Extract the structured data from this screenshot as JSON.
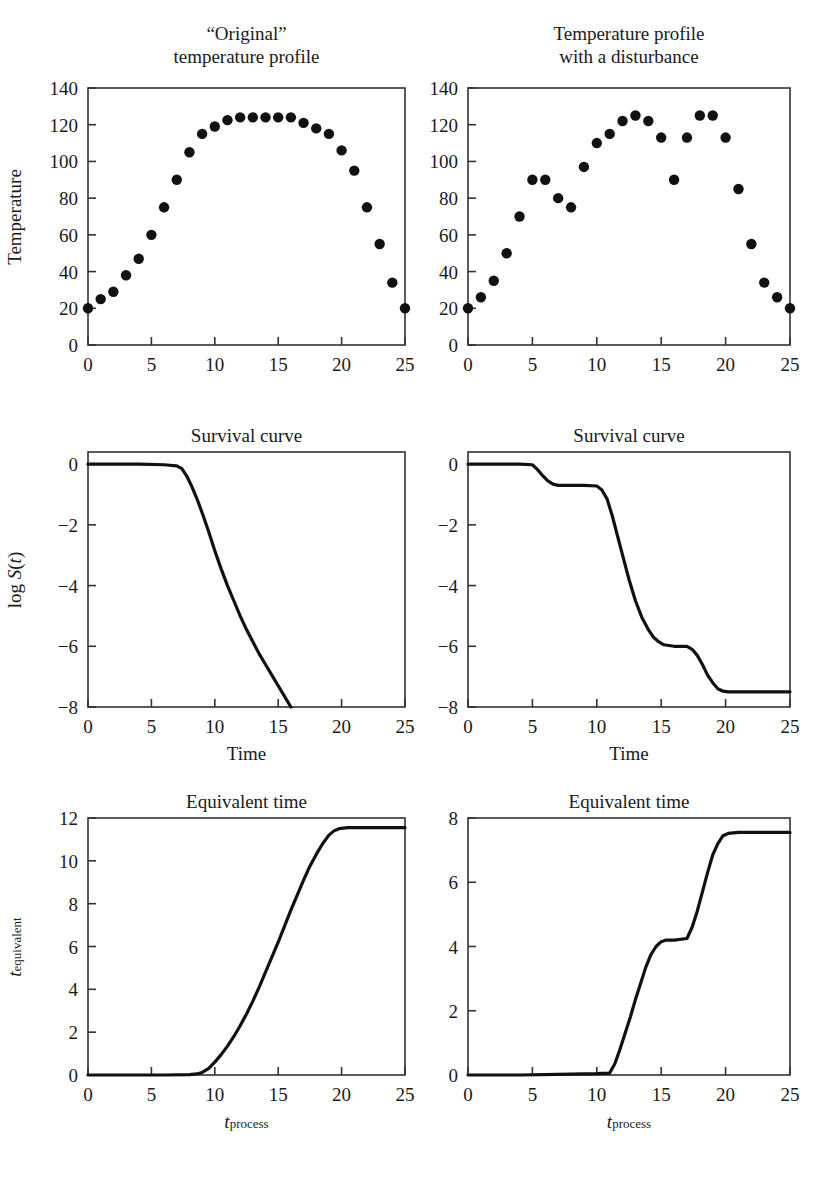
{
  "figure": {
    "width": 827,
    "height": 1192,
    "line_color": "#111111",
    "marker_color": "#111111",
    "axis_color": "#333333"
  },
  "panels": [
    {
      "id": "top-left",
      "title_line1": "“Original”",
      "title_line2": "temperature profile",
      "ylabel": "Temperature",
      "xlabel": "",
      "yticks": [
        "0",
        "20",
        "40",
        "60",
        "80",
        "100",
        "120",
        "140"
      ],
      "xticks": [
        "0",
        "5",
        "10",
        "15",
        "20",
        "25"
      ]
    },
    {
      "id": "top-right",
      "title_line1": "Temperature profile",
      "title_line2": "with a disturbance",
      "ylabel": "",
      "xlabel": "",
      "yticks": [
        "0",
        "20",
        "40",
        "60",
        "80",
        "100",
        "120",
        "140"
      ],
      "xticks": [
        "0",
        "5",
        "10",
        "15",
        "20",
        "25"
      ]
    },
    {
      "id": "mid-left",
      "title_line1": "Survival curve",
      "title_line2": "",
      "ylabel": "log S(t)",
      "xlabel": "Time",
      "yticks": [
        "−8",
        "−6",
        "−4",
        "−2",
        "0"
      ],
      "xticks": [
        "0",
        "5",
        "10",
        "15",
        "20",
        "25"
      ]
    },
    {
      "id": "mid-right",
      "title_line1": "Survival curve",
      "title_line2": "",
      "ylabel": "",
      "xlabel": "Time",
      "yticks": [
        "−8",
        "−6",
        "−4",
        "−2",
        "0"
      ],
      "xticks": [
        "0",
        "5",
        "10",
        "15",
        "20",
        "25"
      ]
    },
    {
      "id": "bot-left",
      "title_line1": "Equivalent time",
      "title_line2": "",
      "ylabel": "t_equivalent",
      "xlabel": "t_process",
      "yticks": [
        "0",
        "2",
        "4",
        "6",
        "8",
        "10",
        "12"
      ],
      "xticks": [
        "0",
        "5",
        "10",
        "15",
        "20",
        "25"
      ]
    },
    {
      "id": "bot-right",
      "title_line1": "Equivalent time",
      "title_line2": "",
      "ylabel": "",
      "xlabel": "t_process",
      "yticks": [
        "0",
        "2",
        "4",
        "6",
        "8"
      ],
      "xticks": [
        "0",
        "5",
        "10",
        "15",
        "20",
        "25"
      ]
    }
  ],
  "chart_data": [
    {
      "type": "scatter",
      "panel": "top-left",
      "title": "“Original” temperature profile",
      "xlabel": "",
      "ylabel": "Temperature",
      "xlim": [
        0,
        25
      ],
      "ylim": [
        0,
        140
      ],
      "xticks": [
        0,
        5,
        10,
        15,
        20,
        25
      ],
      "yticks": [
        0,
        20,
        40,
        60,
        80,
        100,
        120,
        140
      ],
      "grid": false,
      "legend": null,
      "x": [
        0,
        1,
        2,
        3,
        4,
        5,
        6,
        7,
        8,
        9,
        10,
        11,
        12,
        13,
        14,
        15,
        16,
        17,
        18,
        19,
        20,
        21,
        22,
        23,
        24,
        25
      ],
      "y": [
        20,
        25,
        29,
        38,
        47,
        60,
        75,
        90,
        105,
        115,
        119,
        122.5,
        124,
        124,
        124,
        124,
        124,
        121,
        118,
        115,
        106,
        95,
        75,
        55,
        34,
        20
      ]
    },
    {
      "type": "scatter",
      "panel": "top-right",
      "title": "Temperature profile with a disturbance",
      "xlabel": "",
      "ylabel": "",
      "xlim": [
        0,
        25
      ],
      "ylim": [
        0,
        140
      ],
      "xticks": [
        0,
        5,
        10,
        15,
        20,
        25
      ],
      "yticks": [
        0,
        20,
        40,
        60,
        80,
        100,
        120,
        140
      ],
      "grid": false,
      "legend": null,
      "x": [
        0,
        1,
        2,
        3,
        4,
        5,
        6,
        7,
        8,
        9,
        10,
        11,
        12,
        13,
        14,
        15,
        16,
        17,
        18,
        19,
        20,
        21,
        22,
        23,
        24,
        25
      ],
      "y": [
        20,
        26,
        35,
        50,
        70,
        90,
        90,
        80,
        75,
        97,
        110,
        115,
        122,
        125,
        122,
        113,
        90,
        113,
        125,
        125,
        113,
        85,
        55,
        34,
        26,
        20
      ]
    },
    {
      "type": "line",
      "panel": "mid-left",
      "title": "Survival curve",
      "xlabel": "Time",
      "ylabel": "log S(t)",
      "xlim": [
        0,
        25
      ],
      "ylim": [
        -8,
        0.4
      ],
      "xticks": [
        0,
        5,
        10,
        15,
        20,
        25
      ],
      "yticks": [
        -8,
        -6,
        -4,
        -2,
        0
      ],
      "grid": false,
      "legend": null,
      "x": [
        0,
        2,
        4,
        6,
        7,
        7.4,
        7.8,
        8.2,
        8.6,
        9,
        9.5,
        10,
        10.5,
        11,
        11.5,
        12,
        12.5,
        13,
        13.5,
        14,
        14.5,
        15,
        15.5,
        16
      ],
      "y": [
        0,
        0,
        0,
        -0.02,
        -0.06,
        -0.15,
        -0.4,
        -0.75,
        -1.15,
        -1.6,
        -2.2,
        -2.85,
        -3.45,
        -4.0,
        -4.5,
        -5.0,
        -5.45,
        -5.85,
        -6.25,
        -6.6,
        -6.95,
        -7.3,
        -7.65,
        -8.0
      ]
    },
    {
      "type": "line",
      "panel": "mid-right",
      "title": "Survival curve",
      "xlabel": "Time",
      "ylabel": "",
      "xlim": [
        0,
        25
      ],
      "ylim": [
        -8,
        0.4
      ],
      "xticks": [
        0,
        5,
        10,
        15,
        20,
        25
      ],
      "yticks": [
        -8,
        -6,
        -4,
        -2,
        0
      ],
      "grid": false,
      "legend": null,
      "x": [
        0,
        2,
        4,
        5,
        5.4,
        5.8,
        6.2,
        6.6,
        7,
        8,
        9,
        10,
        10.4,
        10.8,
        11.2,
        11.6,
        12,
        12.5,
        13,
        13.5,
        14,
        14.4,
        14.8,
        15.2,
        16,
        17,
        17.4,
        17.8,
        18.2,
        18.6,
        19,
        19.4,
        19.8,
        20.2,
        21,
        23,
        25
      ],
      "y": [
        0,
        0,
        0,
        -0.02,
        -0.18,
        -0.38,
        -0.55,
        -0.66,
        -0.7,
        -0.7,
        -0.7,
        -0.72,
        -0.85,
        -1.15,
        -1.7,
        -2.35,
        -3.0,
        -3.8,
        -4.5,
        -5.05,
        -5.45,
        -5.7,
        -5.85,
        -5.95,
        -6.0,
        -6.0,
        -6.1,
        -6.3,
        -6.6,
        -6.95,
        -7.2,
        -7.4,
        -7.48,
        -7.5,
        -7.5,
        -7.5,
        -7.5
      ]
    },
    {
      "type": "line",
      "panel": "bot-left",
      "title": "Equivalent time",
      "xlabel": "t_process",
      "ylabel": "t_equivalent",
      "xlim": [
        0,
        25
      ],
      "ylim": [
        0,
        12
      ],
      "xticks": [
        0,
        5,
        10,
        15,
        20,
        25
      ],
      "yticks": [
        0,
        2,
        4,
        6,
        8,
        10,
        12
      ],
      "grid": false,
      "legend": null,
      "x": [
        0,
        3,
        6,
        8,
        8.6,
        9,
        9.5,
        10,
        10.5,
        11,
        11.5,
        12,
        12.5,
        13,
        13.5,
        14,
        14.5,
        15,
        15.5,
        16,
        16.5,
        17,
        17.5,
        18,
        18.5,
        19,
        19.4,
        19.8,
        20.5,
        22,
        25
      ],
      "y": [
        0,
        0,
        0,
        0.02,
        0.05,
        0.12,
        0.3,
        0.6,
        0.95,
        1.35,
        1.8,
        2.3,
        2.85,
        3.45,
        4.1,
        4.8,
        5.5,
        6.2,
        6.95,
        7.7,
        8.4,
        9.1,
        9.75,
        10.3,
        10.8,
        11.2,
        11.4,
        11.5,
        11.55,
        11.55,
        11.55
      ]
    },
    {
      "type": "line",
      "panel": "bot-right",
      "title": "Equivalent time",
      "xlabel": "t_process",
      "ylabel": "",
      "xlim": [
        0,
        25
      ],
      "ylim": [
        0,
        8
      ],
      "xticks": [
        0,
        5,
        10,
        15,
        20,
        25
      ],
      "yticks": [
        0,
        2,
        4,
        6,
        8
      ],
      "grid": false,
      "legend": null,
      "x": [
        0,
        4,
        7,
        10,
        11,
        11.4,
        11.8,
        12.2,
        12.6,
        13,
        13.4,
        13.8,
        14.2,
        14.6,
        15,
        15.4,
        16,
        17,
        17.4,
        17.8,
        18.2,
        18.6,
        19,
        19.4,
        19.8,
        20.2,
        21,
        23,
        25
      ],
      "y": [
        0,
        0,
        0.02,
        0.04,
        0.06,
        0.35,
        0.8,
        1.3,
        1.8,
        2.35,
        2.85,
        3.35,
        3.75,
        4.0,
        4.15,
        4.2,
        4.2,
        4.25,
        4.6,
        5.1,
        5.7,
        6.3,
        6.85,
        7.2,
        7.45,
        7.52,
        7.55,
        7.55,
        7.55
      ]
    }
  ]
}
